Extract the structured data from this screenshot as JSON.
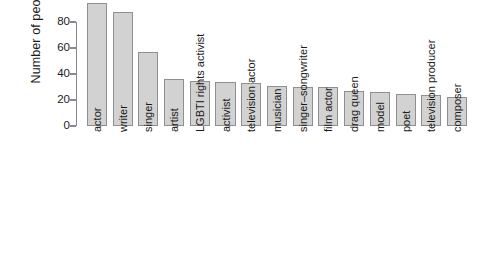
{
  "chart_data": {
    "type": "bar",
    "title": "",
    "xlabel": "",
    "ylabel": "Number of people",
    "ylim": [
      0,
      100
    ],
    "yticks": [
      0,
      20,
      40,
      60,
      80
    ],
    "grid": false,
    "legend": false,
    "orientation": "vertical",
    "bar_fill_color": "#d2d2d2",
    "bar_border_color": "#8f8f8f",
    "categories": [
      "actor",
      "writer",
      "singer",
      "artist",
      "LGBTI rights activist",
      "activist",
      "television actor",
      "musician",
      "singer–songwriter",
      "film actor",
      "drag queen",
      "model",
      "poet",
      "television producer",
      "composer"
    ],
    "values": [
      95,
      88,
      57,
      36,
      35,
      34,
      33,
      31,
      30,
      30,
      27,
      26,
      25,
      24,
      22
    ]
  },
  "axis": {
    "y_tick_labels": [
      "0",
      "20",
      "40",
      "60",
      "80"
    ],
    "y_title": "Number of people"
  }
}
